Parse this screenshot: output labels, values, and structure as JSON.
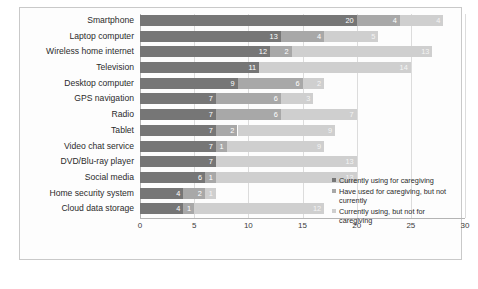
{
  "chart_data": {
    "type": "bar",
    "orientation": "horizontal",
    "stacked": true,
    "title": "",
    "xlabel": "",
    "ylabel": "",
    "xlim": [
      0,
      30
    ],
    "xticks": [
      "0",
      "5",
      "10",
      "15",
      "20",
      "25",
      "30"
    ],
    "grid": true,
    "legend_position": "right",
    "categories": [
      "Smartphone",
      "Laptop computer",
      "Wireless home internet",
      "Television",
      "Desktop computer",
      "GPS navigation",
      "Radio",
      "Tablet",
      "Video chat service",
      "DVD/Blu-ray player",
      "Social media",
      "Home security system",
      "Cloud data storage"
    ],
    "series": [
      {
        "name": "Currently using for caregiving",
        "color": "#767676",
        "values": [
          20,
          13,
          12,
          11,
          9,
          7,
          7,
          7,
          7,
          7,
          6,
          4,
          4
        ]
      },
      {
        "name": "Have used for caregiving, but not currently",
        "color": "#a8a8a8",
        "values": [
          4,
          4,
          2,
          0,
          6,
          6,
          6,
          2,
          1,
          0,
          1,
          2,
          1
        ]
      },
      {
        "name": "Currently using, but not for caregiving",
        "color": "#cfcfcf",
        "values": [
          4,
          5,
          13,
          14,
          2,
          3,
          7,
          9,
          9,
          13,
          13,
          1,
          12
        ]
      }
    ]
  },
  "legend": {
    "items": [
      "Currently using for caregiving",
      "Have used for caregiving, but not currently",
      "Currently using, but not for caregiving"
    ]
  },
  "caption": ""
}
